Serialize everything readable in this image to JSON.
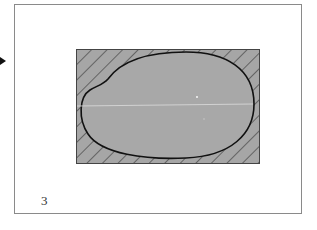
{
  "page": {
    "page_number": "3"
  },
  "figure": {
    "colors": {
      "fill": "#a6a6a6",
      "hatch": "#2a2a2a",
      "outline": "#111111",
      "axis_line": "#dddddd",
      "page_border": "#8a8a8a"
    }
  },
  "pointer": {
    "icon": "triangle-right-icon"
  }
}
